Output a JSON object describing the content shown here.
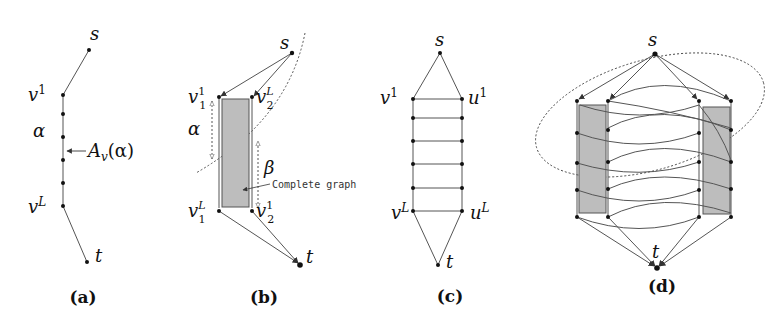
{
  "figure": {
    "panels": [
      {
        "id": "a",
        "caption": "(a)",
        "labels": {
          "s": "s",
          "v1_base": "v",
          "v1_sup": "1",
          "alpha": "α",
          "A_v": "A",
          "A_v_sub": "v",
          "A_v_arg": "(α)",
          "vL_base": "v",
          "vL_sup": "L",
          "t": "t"
        }
      },
      {
        "id": "b",
        "caption": "(b)",
        "labels": {
          "s": "s",
          "v11_base": "v",
          "v11_sub": "1",
          "v11_sup": "1",
          "v2L_base": "v",
          "v2L_sub": "2",
          "v2L_sup": "L",
          "alpha": "α",
          "beta": "β",
          "complete_graph": "Complete graph",
          "v1L_base": "v",
          "v1L_sub": "1",
          "v1L_sup": "L",
          "v21_base": "v",
          "v21_sub": "2",
          "v21_sup": "1",
          "t": "t"
        }
      },
      {
        "id": "c",
        "caption": "(c)",
        "labels": {
          "s": "s",
          "v1_base": "v",
          "v1_sup": "1",
          "u1_base": "u",
          "u1_sup": "1",
          "vL_base": "v",
          "vL_sup": "L",
          "uL_base": "u",
          "uL_sup": "L",
          "t": "t"
        }
      },
      {
        "id": "d",
        "caption": "(d)",
        "labels": {
          "s": "s",
          "t": "t"
        }
      }
    ],
    "colors": {
      "edge": "#555555",
      "node": "#111111",
      "shaded": "#bdbdbd",
      "background": "#ffffff"
    }
  }
}
